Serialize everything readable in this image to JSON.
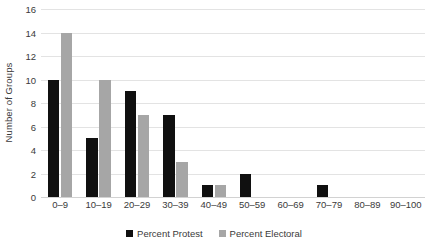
{
  "chart_data": {
    "type": "bar",
    "title": "",
    "subtitle": "",
    "xlabel": "",
    "ylabel": "Number of Groups",
    "ylim": [
      0,
      16
    ],
    "ytick_step": 2,
    "yticks": [
      0,
      2,
      4,
      6,
      8,
      10,
      12,
      14,
      16
    ],
    "grid": true,
    "legend_position": "bottom",
    "categories": [
      "0–9",
      "10–19",
      "20–29",
      "30–39",
      "40–49",
      "50–59",
      "60–69",
      "70–79",
      "80–89",
      "90–100"
    ],
    "series": [
      {
        "name": "Percent Protest",
        "color": "#101010",
        "values": [
          10,
          5,
          9,
          7,
          1,
          2,
          0,
          1,
          0,
          0
        ]
      },
      {
        "name": "Percent Electoral",
        "color": "#a6a6a6",
        "values": [
          14,
          10,
          7,
          3,
          1,
          0,
          0,
          0,
          0,
          0
        ]
      }
    ]
  },
  "colors": {
    "protest": "#101010",
    "electoral": "#a6a6a6",
    "gridline": "#e3e3e3",
    "text": "#3a3a3a",
    "background": "#ffffff"
  }
}
